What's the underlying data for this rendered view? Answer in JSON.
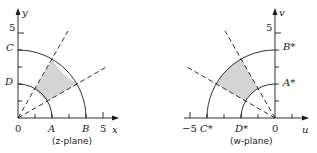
{
  "z_plane": {
    "caption": "(z-plane)",
    "x_axis_label": "x",
    "y_axis_label": "y",
    "tick_x_5": "5",
    "tick_y_5": "5",
    "origin_label": "0",
    "points": {
      "A": "A",
      "B": "B",
      "C": "C",
      "D": "D"
    },
    "inner_radius": 2,
    "outer_radius": 4,
    "ray_angles_deg": [
      30,
      60
    ],
    "shaded_region": "annular sector 2≤|z|≤4, 30°≤arg z≤60°"
  },
  "w_plane": {
    "caption": "(w-plane)",
    "u_axis_label": "u",
    "v_axis_label": "v",
    "tick_u_neg5": "−5",
    "tick_v_5": "5",
    "origin_label": "0",
    "points": {
      "A": "A*",
      "B": "B*",
      "C": "C*",
      "D": "D*"
    },
    "inner_radius": 2,
    "outer_radius": 4,
    "ray_angles_deg": [
      120,
      150
    ],
    "shaded_region": "annular sector, 120°≤arg w≤150°"
  },
  "colors": {
    "shade": "#d4d4d4",
    "line": "#1a1a1a"
  }
}
